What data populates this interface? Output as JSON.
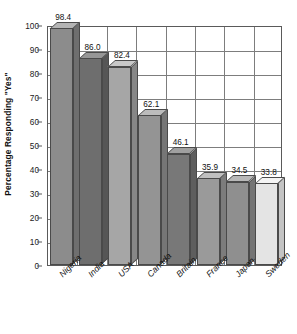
{
  "chart_data": {
    "type": "bar",
    "title": "",
    "subtitle": "",
    "xlabel": "",
    "ylabel": "Percentage Responding \"Yes\"",
    "categories": [
      "Nigeria",
      "India",
      "USA",
      "Canada",
      "Britain",
      "France",
      "Japan",
      "Sweden"
    ],
    "values": [
      98.4,
      86.0,
      82.4,
      62.1,
      46.1,
      35.9,
      34.5,
      33.8
    ],
    "value_labels": [
      "98.4",
      "86.0",
      "82.4",
      "62.1",
      "46.1",
      "35.9",
      "34.5",
      "33.8"
    ],
    "ylim": [
      0,
      100
    ],
    "ytick_labels": [
      "0",
      "10",
      "20",
      "30",
      "40",
      "50",
      "60",
      "70",
      "80",
      "90",
      "100"
    ],
    "ytick_values": [
      0,
      10,
      20,
      30,
      40,
      50,
      60,
      70,
      80,
      90,
      100
    ],
    "grid": "both",
    "legend": "none",
    "style": "3d-bar",
    "bar_colors": [
      "#8c8c8c",
      "#6e6e6e",
      "#a6a6a6",
      "#949494",
      "#787878",
      "#9a9a9a",
      "#8f8f8f",
      "#e4e4e4"
    ],
    "bar_top_colors": [
      "#b4b4b4",
      "#969696",
      "#c8c8c8",
      "#bcbcbc",
      "#a0a0a0",
      "#c0c0c0",
      "#b8b8b8",
      "#f4f4f4"
    ],
    "bar_side_colors": [
      "#6f6f6f",
      "#565656",
      "#878787",
      "#767676",
      "#5e5e5e",
      "#7c7c7c",
      "#747474",
      "#c4c4c4"
    ],
    "axis_color": "#5a5a5a",
    "grid_color": "#7d7d7d",
    "text_color": "#111111",
    "background": "#ffffff"
  }
}
